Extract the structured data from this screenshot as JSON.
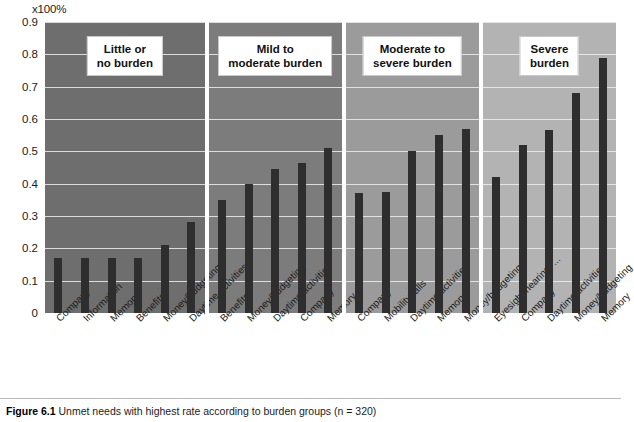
{
  "figure": {
    "caption_label": "Figure 6.1",
    "caption_text": "Unmet needs with highest rate according to burden groups (n = 320)"
  },
  "chart_data": {
    "type": "bar",
    "title": "",
    "xlabel": "",
    "ylabel": "",
    "axis_unit": "x100%",
    "ylim": [
      0,
      0.9
    ],
    "ytick_labels": [
      "0",
      "0.1",
      "0.2",
      "0.3",
      "0.4",
      "0.5",
      "0.6",
      "0.7",
      "0.8",
      "0.9"
    ],
    "ytick_values": [
      0,
      0.1,
      0.2,
      0.3,
      0.4,
      0.5,
      0.6,
      0.7,
      0.8,
      0.9
    ],
    "grid": true,
    "legend": "none",
    "panel_grouping": "burden group",
    "panels": [
      {
        "title": "Little or no burden",
        "background": "#6e6e6e",
        "categories": [
          "Company",
          "Information",
          "Memory",
          "Benefits",
          "Money/budgeting",
          "Daytime activities"
        ],
        "values": [
          0.17,
          0.17,
          0.17,
          0.17,
          0.21,
          0.28
        ]
      },
      {
        "title": "Mild to moderate burden",
        "background": "#7c7c7c",
        "categories": [
          "Benefits",
          "Money/budgeting",
          "Daytime activities",
          "Company",
          "Memory"
        ],
        "values": [
          0.35,
          0.4,
          0.445,
          0.465,
          0.51
        ]
      },
      {
        "title": "Moderate to severe burden",
        "background": "#9b9b9b",
        "categories": [
          "Company",
          "Mobility/falls",
          "Daytime activities",
          "Memory",
          "Money/budgeting"
        ],
        "values": [
          0.37,
          0.375,
          0.5,
          0.55,
          0.57
        ]
      },
      {
        "title": "Severe burden",
        "background": "#b3b3b3",
        "categories": [
          "Eyesight/hearing/ ...",
          "Company",
          "Daytime activities",
          "Money/budgeting",
          "Memory"
        ],
        "values": [
          0.42,
          0.52,
          0.565,
          0.68,
          0.79
        ]
      }
    ],
    "bar_color": "#2e2e2e",
    "gridline_color": "#eceef0",
    "categories": [
      "Company",
      "Information",
      "Memory",
      "Benefits",
      "Money/budgeting",
      "Daytime activities",
      "Benefits",
      "Money/budgeting",
      "Daytime activities",
      "Company",
      "Memory",
      "Company",
      "Mobility/falls",
      "Daytime activities",
      "Memory",
      "Money/budgeting",
      "Eyesight/hearing/ ...",
      "Company",
      "Daytime activities",
      "Money/budgeting",
      "Memory"
    ],
    "values": [
      0.17,
      0.17,
      0.17,
      0.17,
      0.21,
      0.28,
      0.35,
      0.4,
      0.445,
      0.465,
      0.51,
      0.37,
      0.375,
      0.5,
      0.55,
      0.57,
      0.42,
      0.52,
      0.565,
      0.68,
      0.79
    ]
  }
}
